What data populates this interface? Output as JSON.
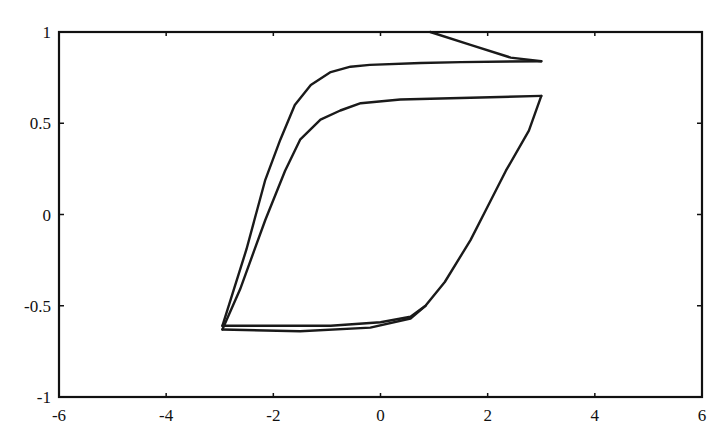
{
  "chart_data": {
    "type": "line",
    "title": "",
    "xlabel": "",
    "ylabel": "",
    "xlim": [
      -6,
      6
    ],
    "ylim": [
      -1,
      1
    ],
    "xticks": [
      -6,
      -4,
      -2,
      0,
      2,
      4,
      6
    ],
    "yticks": [
      -1,
      -0.5,
      0,
      0.5,
      1
    ],
    "xtick_labels": [
      "-6",
      "-4",
      "-2",
      "0",
      "2",
      "4",
      "6"
    ],
    "ytick_labels": [
      "-1",
      "-0.5",
      "0",
      "0.5",
      "1"
    ],
    "grid": false,
    "legend": null,
    "line_color": "#1a1a1a",
    "series": [
      {
        "name": "outer-loop-descending",
        "x": [
          0.93,
          1.68,
          2.43,
          3.0
        ],
        "y": [
          1.0,
          0.93,
          0.86,
          0.84
        ]
      },
      {
        "name": "outer-loop-return",
        "x": [
          3.0,
          1.5,
          0.75,
          -0.2,
          -0.56,
          -0.93,
          -1.3,
          -1.6,
          -1.87,
          -2.15,
          -2.5,
          -2.95
        ],
        "y": [
          0.84,
          0.835,
          0.83,
          0.82,
          0.81,
          0.78,
          0.71,
          0.6,
          0.41,
          0.19,
          -0.19,
          -0.61
        ]
      },
      {
        "name": "lower-branch",
        "x": [
          -2.95,
          -1.5,
          -0.93,
          0.0,
          0.56,
          0.84,
          1.2,
          1.68,
          1.96,
          2.34,
          2.77,
          3.0
        ],
        "y": [
          -0.61,
          -0.61,
          -0.61,
          -0.59,
          -0.56,
          -0.5,
          -0.37,
          -0.14,
          0.02,
          0.24,
          0.46,
          0.65
        ]
      },
      {
        "name": "inner-loop-return",
        "x": [
          3.0,
          1.68,
          0.37,
          -0.37,
          -0.75,
          -1.12,
          -1.5,
          -1.78,
          -2.15,
          -2.62,
          -2.95
        ],
        "y": [
          0.65,
          0.64,
          0.63,
          0.61,
          0.57,
          0.52,
          0.41,
          0.24,
          -0.03,
          -0.41,
          -0.63
        ]
      },
      {
        "name": "inner-lower-branch",
        "x": [
          -2.95,
          -1.5,
          -0.19,
          0.56,
          0.84
        ],
        "y": [
          -0.63,
          -0.64,
          -0.62,
          -0.57,
          -0.5
        ]
      }
    ]
  }
}
